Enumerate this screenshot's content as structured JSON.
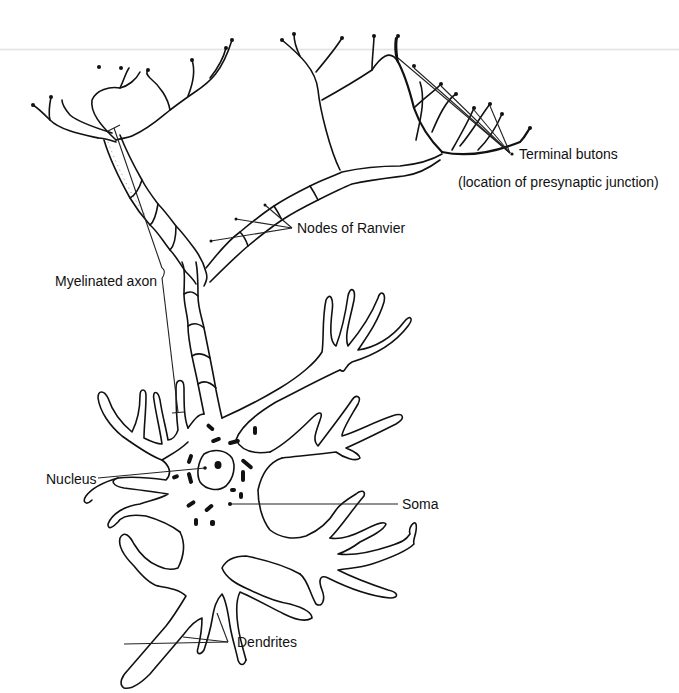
{
  "diagram": {
    "labels": {
      "terminal_butons": "Terminal butons",
      "terminal_butons_note": "(location of presynaptic junction)",
      "nodes_of_ranvier": "Nodes of Ranvier",
      "myelinated_axon": "Myelinated axon",
      "nucleus": "Nucleus",
      "soma": "Soma",
      "dendrites": "Dendrites"
    },
    "colors": {
      "ink": "#111111",
      "background": "#ffffff"
    }
  }
}
